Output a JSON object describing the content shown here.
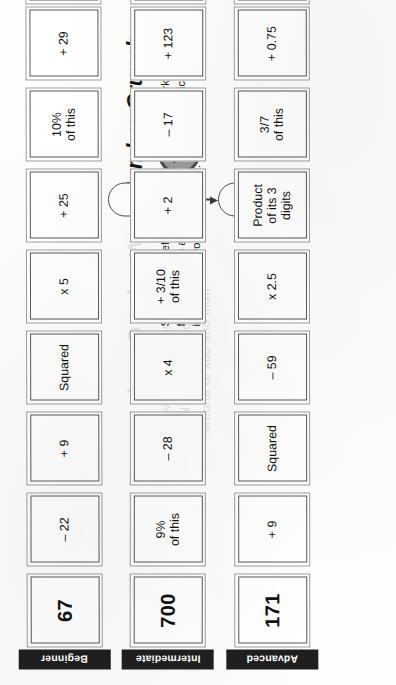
{
  "page": {
    "number": "67",
    "title": "Number Crunch",
    "instructions": "Starting at the left with the number provided, work across from one box to another, applying the mathematical instructions to your running total."
  },
  "ghost_text": {
    "title": "Number Crunch",
    "line1": "Starting at the left with the",
    "line2": "number provided, work across",
    "line3": "from one box to another"
  },
  "icons": {
    "stopwatch": "stopwatch-icon",
    "arrow": "down-arrow-icon"
  },
  "answer_label": "Answer",
  "rows": [
    {
      "level": "Beginner",
      "start": "67",
      "steps": [
        "– 22",
        "+ 9",
        "Squared",
        "x 5",
        "+ 25",
        "10%\nof this",
        "+ 29"
      ],
      "answer": ""
    },
    {
      "level": "Intermediate",
      "start": "700",
      "steps": [
        "9%\nof this",
        "– 28",
        "x 4",
        "+ 3/10\nof this",
        "+ 2",
        "– 17",
        "+ 123"
      ],
      "answer": ""
    },
    {
      "level": "Advanced",
      "start": "171",
      "steps": [
        "+ 9",
        "Squared",
        "– 59",
        "x 2.5",
        "Product\nof its 3\ndigits",
        "3/7\nof this",
        "+ 0.75"
      ],
      "answer": ""
    }
  ]
}
